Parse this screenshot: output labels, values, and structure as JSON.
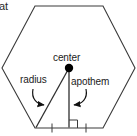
{
  "figure": {
    "title_fragment": "at",
    "shape_name": "hexagon",
    "labels": {
      "center": "center",
      "radius": "radius",
      "apothem": "apothem"
    },
    "colors": {
      "stroke": "#3a3a3a",
      "text": "#1b1b1b",
      "background": "#ffffff",
      "point": "#000000"
    }
  },
  "geometry": {
    "type": "regular-polygon",
    "sides": 6,
    "center": {
      "x": 69,
      "y": 68
    },
    "vertices": [
      {
        "x": 35,
        "y": 6
      },
      {
        "x": 103,
        "y": 6
      },
      {
        "x": 135,
        "y": 68
      },
      {
        "x": 103,
        "y": 128
      },
      {
        "x": 35,
        "y": 128
      },
      {
        "x": 2,
        "y": 68
      }
    ],
    "radius_segment": {
      "from": {
        "x": 69,
        "y": 68
      },
      "to": {
        "x": 36,
        "y": 128
      }
    },
    "apothem_segment": {
      "from": {
        "x": 69,
        "y": 68
      },
      "to": {
        "x": 69,
        "y": 128
      }
    },
    "right_angle_marker": {
      "x": 69,
      "y": 128,
      "size": 8
    },
    "tick_marks": [
      {
        "x": 52,
        "y": 128
      },
      {
        "x": 86,
        "y": 128
      }
    ]
  },
  "annotations": {
    "radius_arrow": {
      "name": "radius-pointer",
      "path": "M 33 89 C 31 99, 37 104, 45 105",
      "arrow_at": {
        "x": 46,
        "y": 105
      }
    },
    "apothem_arrow": {
      "name": "apothem-pointer",
      "path": "M 86 89 C 88 99, 82 104, 73 105",
      "arrow_at": {
        "x": 72,
        "y": 105
      }
    }
  }
}
